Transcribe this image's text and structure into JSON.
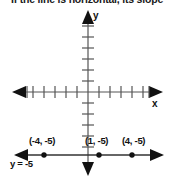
{
  "caption": {
    "text": "If the line is horizontal, its slope"
  },
  "axes": {
    "x_label": "x",
    "y_label": "y",
    "x_axis_y_px": 92,
    "y_axis_x_px": 88,
    "tick_spacing_px": 11,
    "x_ticks_each_side": 6,
    "y_ticks_each_side": 5,
    "axis_color": "#555555",
    "arrow_color": "#111111"
  },
  "line": {
    "equation_label": "y = -5",
    "y_value": -5,
    "line_y_px": 155,
    "color": "#333333",
    "description": "horizontal line"
  },
  "points": [
    {
      "label": "(-4, -5)",
      "x": -4,
      "y": -5,
      "px": 44,
      "py": 155
    },
    {
      "label": "(1, -5)",
      "x": 1,
      "y": -5,
      "px": 99,
      "py": 155
    },
    {
      "label": "(4, -5)",
      "x": 4,
      "y": -5,
      "px": 132,
      "py": 155
    }
  ],
  "colors": {
    "background": "#ffffff",
    "ink": "#111111",
    "axis": "#555555"
  }
}
